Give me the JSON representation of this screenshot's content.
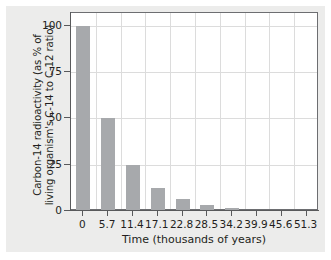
{
  "figure": {
    "background_color": "#ececeb",
    "plot_background_color": "#ffffff",
    "bar_color": "#a7a9ac",
    "axis_color": "#58595b",
    "grid_color": "#dcdcdc"
  },
  "chart_data": {
    "type": "bar",
    "title": "",
    "xlabel": "Time (thousands of years)",
    "ylabel": "Carbon-14 radioactivity (as % of living organism's C-14 to C-12 ratio)",
    "ylabel_line1": "Carbon-14 radioactivity (as % of",
    "ylabel_line2": "living organism's C-14 to C-12 ratio)",
    "categories": [
      "0",
      "5.7",
      "11.4",
      "17.1",
      "22.8",
      "28.5",
      "34.2",
      "39.9",
      "45.6",
      "51.3"
    ],
    "values": [
      100,
      50,
      25,
      12.5,
      6.25,
      3.1,
      1.6,
      0.8,
      0.4,
      0.2
    ],
    "xtick_labels": [
      "0",
      "5.7",
      "11.4",
      "17.1",
      "22.8",
      "28.5",
      "34.2",
      "39.9",
      "45.6",
      "51.3"
    ],
    "ytick_labels": [
      "0",
      "25",
      "50",
      "75",
      "100"
    ],
    "ytick_values": [
      0,
      25,
      50,
      75,
      100
    ],
    "ylim": [
      0,
      107
    ],
    "xlim": [
      -0.5,
      9.5
    ],
    "grid": true,
    "legend": false
  }
}
